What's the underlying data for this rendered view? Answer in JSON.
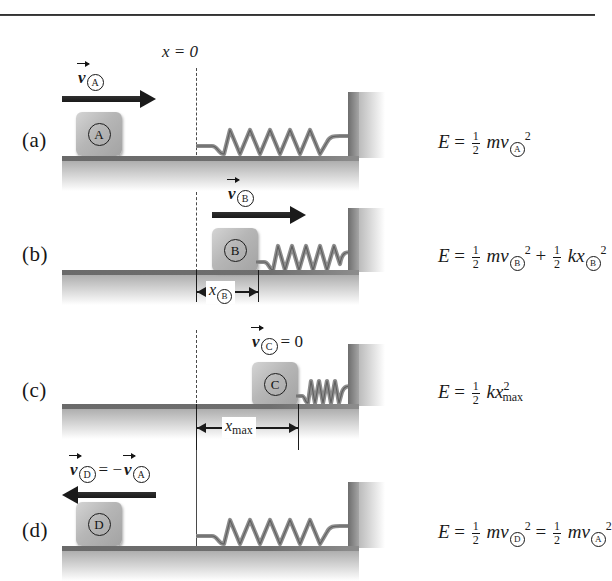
{
  "figure": {
    "axis_origin_label": "x = 0",
    "panels": [
      {
        "id": "a",
        "label": "(a)",
        "block_letter": "A",
        "velocity_label_body": "v",
        "velocity_label_sub": "A",
        "velocity_label_suffix": "",
        "arrow_direction": "right",
        "spring_state": "relaxed",
        "equation": {
          "lhs": "E",
          "eq": "=",
          "terms": [
            {
              "frac_num": "1",
              "frac_den": "2",
              "body": "mv",
              "sub": "A",
              "sup": "2"
            }
          ]
        }
      },
      {
        "id": "b",
        "label": "(b)",
        "block_letter": "B",
        "velocity_label_body": "v",
        "velocity_label_sub": "B",
        "velocity_label_suffix": "",
        "arrow_direction": "right",
        "spring_state": "partly-compressed",
        "dimension_label_body": "x",
        "dimension_label_sub": "B",
        "equation": {
          "lhs": "E",
          "eq": "=",
          "terms": [
            {
              "frac_num": "1",
              "frac_den": "2",
              "body": "mv",
              "sub": "B",
              "sup": "2"
            },
            {
              "op": "+",
              "frac_num": "1",
              "frac_den": "2",
              "body": "kx",
              "sub": "B",
              "sup": "2"
            }
          ]
        }
      },
      {
        "id": "c",
        "label": "(c)",
        "block_letter": "C",
        "velocity_label_body": "v",
        "velocity_label_sub": "C",
        "velocity_label_suffix": "= 0",
        "arrow_direction": "none",
        "spring_state": "compressed",
        "dimension_label_body": "x",
        "dimension_label_sub": "max",
        "equation": {
          "lhs": "E",
          "eq": "=",
          "terms": [
            {
              "frac_num": "1",
              "frac_den": "2",
              "body": "kx",
              "sub": "max",
              "sup": "2"
            }
          ]
        }
      },
      {
        "id": "d",
        "label": "(d)",
        "block_letter": "D",
        "velocity_label_body": "v",
        "velocity_label_sub": "D",
        "velocity_label_suffix": "= −",
        "velocity_label_body2": "v",
        "velocity_label_sub2": "A",
        "arrow_direction": "left",
        "spring_state": "relaxed",
        "equation": {
          "lhs": "E",
          "eq": "=",
          "terms": [
            {
              "frac_num": "1",
              "frac_den": "2",
              "body": "mv",
              "sub": "D",
              "sup": "2"
            },
            {
              "op": "=",
              "frac_num": "1",
              "frac_den": "2",
              "body": "mv",
              "sub": "A",
              "sup": "2"
            }
          ]
        }
      }
    ]
  },
  "colors": {
    "block_fill": "#b6b6b6",
    "ground": "#6f6f6f",
    "wall": "#8c8c8c",
    "spring": "#8a8a8a",
    "ink": "#1a1a1a"
  }
}
